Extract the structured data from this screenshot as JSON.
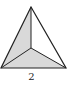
{
  "figure": {
    "type": "triangular-pyramid-top-view",
    "vertices": {
      "apex_top": [
        31,
        7
      ],
      "bottom_left": [
        1,
        68
      ],
      "bottom_right": [
        66,
        68
      ],
      "inner": [
        31,
        48
      ]
    },
    "faces": [
      {
        "name": "left-face",
        "shaded": true,
        "fill": "#d9d9d9"
      },
      {
        "name": "right-face",
        "shaded": false,
        "fill": "#ffffff"
      },
      {
        "name": "bottom-face",
        "shaded": true,
        "fill": "#d9d9d9"
      }
    ],
    "stroke_color": "#222222"
  },
  "label": "2"
}
